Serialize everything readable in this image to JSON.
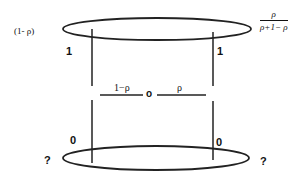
{
  "diagram": {
    "top_ring": {
      "left_label": "(1- ρ)",
      "right_label": {
        "numerator": "ρ",
        "denominator": "ρ+1− ρ"
      }
    },
    "left_wire": {
      "top_value": "1",
      "bottom_value": "0"
    },
    "right_wire": {
      "top_value": "1",
      "bottom_value": "0"
    },
    "middle": {
      "left_label": "1−ρ",
      "center_label": "o",
      "right_label": "ρ"
    },
    "bottom_ring": {
      "left_label": "?",
      "right_label": "?"
    },
    "colors": {
      "stroke": "#222222",
      "background": "#ffffff"
    }
  }
}
